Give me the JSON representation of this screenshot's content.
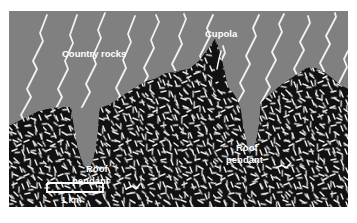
{
  "figure": {
    "type": "geological-cross-section",
    "frame": {
      "x": 9,
      "y": 11,
      "width": 339,
      "height": 196
    },
    "background_color": "#ffffff"
  },
  "units": {
    "country_rock": {
      "name": "Country rocks",
      "color": "#808080",
      "ornament": "white-kinked-foliation-lines",
      "ornament_color": "#f2f2f2"
    },
    "pluton": {
      "name": "Granite pluton",
      "color": "#111111",
      "ornament": "white-random-crystal-dashes",
      "ornament_color": "#e8e8e8"
    }
  },
  "labels": [
    {
      "id": "country-rocks",
      "text": "Country rocks",
      "x": 62,
      "y": 56,
      "anchor": "start",
      "color": "#ffffff"
    },
    {
      "id": "cupola",
      "text": "Cupola",
      "x": 205,
      "y": 37,
      "anchor": "start",
      "color": "#ffffff",
      "leader": "curve-down-to-spike"
    },
    {
      "id": "roof-pendant-left-line1",
      "text": "Roof",
      "x": 86,
      "y": 170,
      "anchor": "start",
      "color": "#ffffff"
    },
    {
      "id": "roof-pendant-left-line2",
      "text": "pendant",
      "x": 72,
      "y": 182,
      "anchor": "start",
      "color": "#ffffff",
      "leader": "squiggle-up-left-to-wedge"
    },
    {
      "id": "roof-pendant-right-line1",
      "text": "Roof",
      "x": 236,
      "y": 149,
      "anchor": "start",
      "color": "#ffffff"
    },
    {
      "id": "roof-pendant-right-line2",
      "text": "pendant",
      "x": 226,
      "y": 161,
      "anchor": "start",
      "color": "#ffffff",
      "leader": "squiggle-up-right-to-wedge"
    }
  ],
  "scale_bar": {
    "label": "1 km",
    "label_x": 74,
    "label_y": 200,
    "bar": {
      "x": 47,
      "y": 182,
      "width": 56,
      "height": 9
    },
    "color": "#ffffff"
  },
  "features": {
    "cupola": {
      "description": "Narrow upward spike of pluton piercing the country rocks",
      "apex_x": 214,
      "apex_y": 44
    },
    "roof_pendants": [
      {
        "side": "left",
        "tip_x": 95,
        "tip_y": 158
      },
      {
        "side": "right",
        "tip_x": 240,
        "tip_y": 143
      }
    ]
  },
  "foliation_lines": {
    "count": 11,
    "orientation_deg": 62,
    "style": "kinked-white-lines",
    "color": "#f2f2f2"
  }
}
